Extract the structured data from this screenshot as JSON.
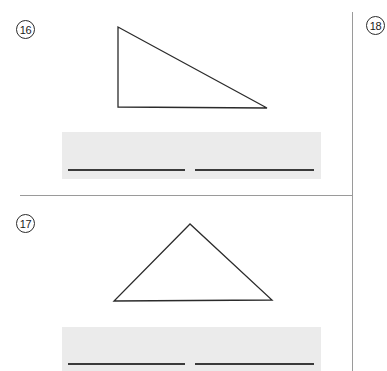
{
  "page": {
    "width": 387,
    "height": 371,
    "background_color": "#ffffff",
    "line_color": "#9a9a9a",
    "ink_color": "#2b2b2b",
    "answer_box_color": "#ebebeb",
    "answer_rule_color": "#3a3a3a"
  },
  "problems": [
    {
      "number": "16",
      "figure": {
        "shape_name": "right-triangle",
        "vertices": [
          [
            13,
            9
          ],
          [
            13,
            89
          ],
          [
            162,
            90
          ]
        ]
      },
      "answer_area": {
        "line_count": 2,
        "left_line_value": "",
        "right_line_value": ""
      }
    },
    {
      "number": "17",
      "figure": {
        "shape_name": "isosceles-triangle",
        "vertices": [
          [
            87,
            11
          ],
          [
            11,
            88
          ],
          [
            169,
            87
          ]
        ]
      },
      "answer_area": {
        "line_count": 2,
        "left_line_value": "",
        "right_line_value": ""
      }
    },
    {
      "number": "18",
      "figure": null,
      "answer_area": null
    }
  ]
}
